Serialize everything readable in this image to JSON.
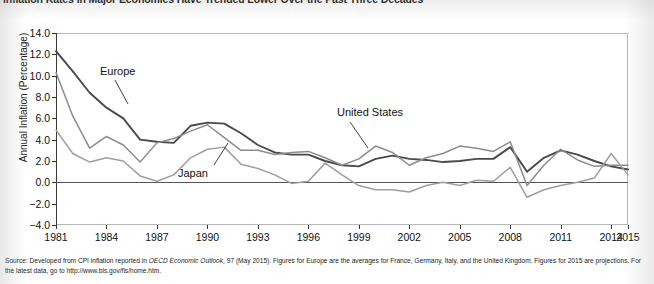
{
  "title": "Inflation Rates in Major Economies Have Trended Lower Over the Past Three Decades",
  "axis": {
    "y_title": "Annual Inflation (Percentage)",
    "y_ticks": [
      "14.0",
      "12.0",
      "10.0",
      "8.0",
      "6.0",
      "4.0",
      "2.0",
      "0.0",
      "-2.0",
      "-4.0"
    ],
    "x_ticks": [
      "1981",
      "1984",
      "1987",
      "1990",
      "1993",
      "1996",
      "1999",
      "2002",
      "2005",
      "2008",
      "2011",
      "2014",
      "2015"
    ]
  },
  "annotations": {
    "europe": "Europe",
    "japan": "Japan",
    "united_states": "United States"
  },
  "source": {
    "lead": "Source: Developed from CPI inflation reported in ",
    "italic": "OECD Economic Outlook",
    "rest": ", 97 (May 2015). Figures for Europe are the averages for France, Germany, Italy, and the United Kingdom. Figures for 2015 are projections. For the latest data, go to http://www.bls.gov/fls/home.htm."
  },
  "colors": {
    "europe": "#4a4a4a",
    "united_states": "#8c8c8c",
    "japan": "#9e9e9e",
    "frame": "#b9b9b9",
    "axis": "#3a3a3a"
  },
  "chart_data": {
    "type": "line",
    "title": "Inflation Rates in Major Economies Have Trended Lower Over the Past Three Decades",
    "xlabel": "",
    "ylabel": "Annual Inflation (Percentage)",
    "ylim": [
      -4.0,
      14.0
    ],
    "xlim": [
      1981,
      2015
    ],
    "ytick_step": 2.0,
    "grid": false,
    "legend": "inline-annotations",
    "x": [
      1981,
      1982,
      1983,
      1984,
      1985,
      1986,
      1987,
      1988,
      1989,
      1990,
      1991,
      1992,
      1993,
      1994,
      1995,
      1996,
      1997,
      1998,
      1999,
      2000,
      2001,
      2002,
      2003,
      2004,
      2005,
      2006,
      2007,
      2008,
      2009,
      2010,
      2011,
      2012,
      2013,
      2014,
      2015
    ],
    "series": [
      {
        "name": "Europe",
        "color": "#4a4a4a",
        "values": [
          12.3,
          10.4,
          8.4,
          7.0,
          6.0,
          4.0,
          3.8,
          3.7,
          5.3,
          5.6,
          5.5,
          4.6,
          3.5,
          2.8,
          2.6,
          2.6,
          2.0,
          1.6,
          1.5,
          2.2,
          2.5,
          2.2,
          2.1,
          1.9,
          2.0,
          2.2,
          2.2,
          3.3,
          1.0,
          2.3,
          3.0,
          2.6,
          2.0,
          1.5,
          1.2
        ]
      },
      {
        "name": "United States",
        "color": "#8c8c8c",
        "values": [
          10.3,
          6.2,
          3.2,
          4.3,
          3.5,
          1.9,
          3.7,
          4.1,
          4.8,
          5.4,
          4.2,
          3.0,
          3.0,
          2.6,
          2.8,
          2.9,
          2.3,
          1.6,
          2.2,
          3.4,
          2.8,
          1.6,
          2.3,
          2.7,
          3.4,
          3.2,
          2.9,
          3.8,
          -0.3,
          1.6,
          3.1,
          2.1,
          1.5,
          1.6,
          1.6
        ]
      },
      {
        "name": "Japan",
        "color": "#9e9e9e",
        "values": [
          4.9,
          2.7,
          1.9,
          2.3,
          2.0,
          0.6,
          0.1,
          0.7,
          2.3,
          3.1,
          3.3,
          1.7,
          1.3,
          0.7,
          -0.1,
          0.1,
          1.8,
          0.7,
          -0.3,
          -0.7,
          -0.7,
          -0.9,
          -0.3,
          0.0,
          -0.3,
          0.2,
          0.1,
          1.4,
          -1.4,
          -0.7,
          -0.3,
          0.0,
          0.4,
          2.7,
          0.7
        ]
      }
    ]
  }
}
